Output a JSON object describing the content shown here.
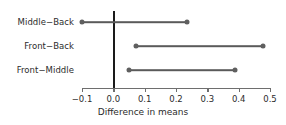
{
  "chart_data": {
    "type": "scatter",
    "title": "",
    "xlabel": "Difference in means",
    "ylabel": "",
    "xlim": [
      -0.13,
      0.53
    ],
    "xticks": [
      -0.1,
      0.0,
      0.1,
      0.2,
      0.3,
      0.4,
      0.5
    ],
    "xticklabels": [
      "-0.1",
      "0.0",
      "0.1",
      "0.2",
      "0.3",
      "0.4",
      "0.5"
    ],
    "grid": false,
    "legend": null,
    "reference_line": {
      "x": 0.0,
      "color": "#1a1a1a"
    },
    "categories": [
      "Middle−Back",
      "Front−Back",
      "Front−Middle"
    ],
    "intervals": [
      {
        "label": "Middle−Back",
        "lower": -0.1,
        "upper": 0.235
      },
      {
        "label": "Front−Back",
        "lower": 0.072,
        "upper": 0.478
      },
      {
        "label": "Front−Middle",
        "lower": 0.05,
        "upper": 0.388
      }
    ],
    "marker_color": "#5f5f5f",
    "line_color": "#5a5a5a",
    "axis_color": "#6e6e6e"
  }
}
